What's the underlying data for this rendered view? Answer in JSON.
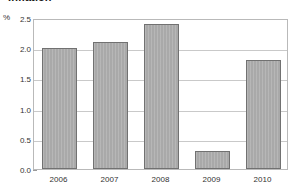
{
  "chart_data": {
    "type": "bar",
    "title": "Inflation",
    "xlabel": "",
    "ylabel": "%",
    "unit": "%",
    "categories": [
      "2006",
      "2007",
      "2008",
      "2009",
      "2010"
    ],
    "values": [
      2.0,
      2.1,
      2.4,
      0.3,
      1.8
    ],
    "ylim": [
      0.0,
      2.5
    ],
    "ytick_labels": [
      "0.0",
      "0.5",
      "1.0",
      "1.5",
      "2.0",
      "2.5"
    ],
    "ytick_values": [
      0.0,
      0.5,
      1.0,
      1.5,
      2.0,
      2.5
    ],
    "grid": true,
    "legend": false,
    "series": [
      {
        "name": "Inflation",
        "values": [
          2.0,
          2.1,
          2.4,
          0.3,
          1.8
        ]
      }
    ],
    "colors": {
      "bar_fill": "#a9a9a9",
      "bar_border": "#717171",
      "gridline": "#c9c9c9",
      "frame": "#b9b9b9",
      "text": "#333333",
      "title": "#1a1a1a",
      "background": "#ffffff"
    }
  }
}
